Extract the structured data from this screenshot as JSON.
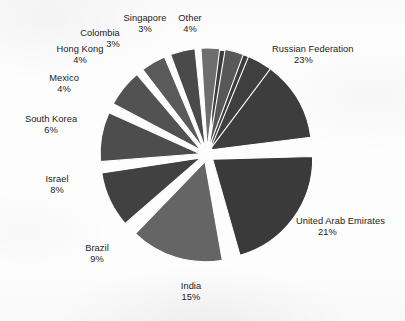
{
  "chart_data": {
    "type": "pie",
    "title": "",
    "subtitle": "",
    "xlabel": "",
    "ylabel": "",
    "legend_position": "none",
    "grid": false,
    "exploded": true,
    "value_unit": "percent",
    "total": 100,
    "categories": [
      "Russian Federation",
      "United Arab Emirates",
      "India",
      "Brazil",
      "Israel",
      "South Korea",
      "Mexico",
      "Hong Kong",
      "Colombia",
      "Singapore",
      "Other"
    ],
    "values": [
      23,
      21,
      15,
      9,
      8,
      6,
      4,
      4,
      3,
      3,
      4
    ],
    "slices": [
      {
        "label": "Russian Federation",
        "value": 23,
        "value_text": "23%",
        "color": "#3d3d3d",
        "start_angle": 4,
        "end_angle": 86.8,
        "label_x": 272,
        "label_y": 44,
        "align": "left",
        "pct_align": "indent"
      },
      {
        "label": "United Arab Emirates",
        "value": 21,
        "value_text": "21%",
        "color": "#3a3a3a",
        "start_angle": 92.5,
        "end_angle": 168.1,
        "label_x": 296,
        "label_y": 216,
        "align": "left",
        "pct_align": "indent"
      },
      {
        "label": "India",
        "value": 15,
        "value_text": "15%",
        "color": "#656565",
        "start_angle": 174,
        "end_angle": 228,
        "label_x": 191,
        "label_y": 281,
        "align": "center",
        "pct_align": "center"
      },
      {
        "label": "Brazil",
        "value": 9,
        "value_text": "9%",
        "color": "#414141",
        "start_angle": 233,
        "end_angle": 265.4,
        "label_x": 97,
        "label_y": 243,
        "align": "center",
        "pct_align": "center"
      },
      {
        "label": "Israel",
        "value": 8,
        "value_text": "8%",
        "color": "#4d4d4d",
        "start_angle": 269.5,
        "end_angle": 298.3,
        "label_x": 57,
        "label_y": 174,
        "align": "center",
        "pct_align": "center"
      },
      {
        "label": "South Korea",
        "value": 6,
        "value_text": "6%",
        "color": "#525252",
        "start_angle": 302,
        "end_angle": 323.6,
        "label_x": 51,
        "label_y": 114,
        "align": "center",
        "pct_align": "center"
      },
      {
        "label": "Mexico",
        "value": 4,
        "value_text": "4%",
        "color": "#5a5a5a",
        "start_angle": 326.6,
        "end_angle": 341,
        "label_x": 64,
        "label_y": 73,
        "align": "center",
        "pct_align": "center"
      },
      {
        "label": "Hong Kong",
        "value": 4,
        "value_text": "4%",
        "color": "#4a4a4a",
        "start_angle": 343.6,
        "end_angle": 358,
        "label_x": 80,
        "label_y": 44,
        "align": "center",
        "pct_align": "center"
      },
      {
        "label": "Colombia",
        "value": 3,
        "value_text": "3%",
        "color": "#6e6e6e",
        "start_angle": 0.4,
        "end_angle": 11.2,
        "label_x": 100,
        "label_y": 28,
        "align": "center",
        "pct_align": "right"
      },
      {
        "label": "Singapore",
        "value": 3,
        "value_text": "3%",
        "color": "#585858",
        "start_angle": 13.4,
        "end_angle": 24.2,
        "label_x": 145,
        "label_y": 13,
        "align": "center",
        "pct_align": "center"
      },
      {
        "label": "Other",
        "value": 4,
        "value_text": "4%",
        "color": "#3f3f3f",
        "start_angle": 26.4,
        "end_angle": 40.8,
        "label_x": 190,
        "label_y": 13,
        "align": "center",
        "pct_align": "center"
      }
    ],
    "geometry": {
      "center_x": 207,
      "center_y": 155,
      "radius": 100,
      "explode_offset": 7,
      "rotation_deg": -94
    },
    "colors": {
      "background": "#fdfdfd",
      "text": "#1b1b1b",
      "gap": "#ffffff"
    }
  }
}
